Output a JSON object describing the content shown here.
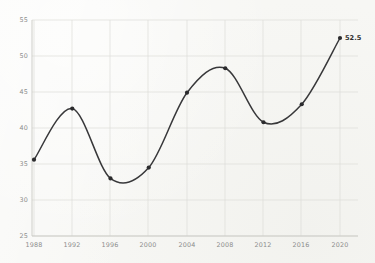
{
  "chart_data": {
    "type": "line",
    "title": "",
    "subtitle": "",
    "xlabel": "",
    "ylabel": "",
    "categories": [
      "1988",
      "1992",
      "1996",
      "2000",
      "2004",
      "2008",
      "2012",
      "2016",
      "2020"
    ],
    "x": [
      1988,
      1992,
      1996,
      2000,
      2004,
      2008,
      2012,
      2016,
      2020
    ],
    "values": [
      35.6,
      42.7,
      33.0,
      34.5,
      44.9,
      48.3,
      40.8,
      43.3,
      52.5
    ],
    "series": [
      {
        "name": "",
        "values": [
          35.6,
          42.7,
          33.0,
          34.5,
          44.9,
          48.3,
          40.8,
          43.3,
          52.5
        ]
      }
    ],
    "xlim": [
      1988,
      2020
    ],
    "ylim": [
      25,
      55
    ],
    "ytick_labels": [
      "55",
      "50",
      "45",
      "40",
      "35",
      "30",
      "25"
    ],
    "ytick_values": [
      55,
      50,
      45,
      40,
      35,
      30,
      25
    ],
    "xtick_labels": [
      "1988",
      "1992",
      "1996",
      "2000",
      "2004",
      "2008",
      "2012",
      "2016",
      "2020"
    ],
    "grid": true,
    "legend": false,
    "legend_position": "none",
    "markers": true,
    "smoothing": "spline",
    "annotations": [
      {
        "label": "52.5",
        "x": 2020,
        "y": 52.5
      }
    ],
    "colors": {
      "line": "#38383a",
      "marker": "#2b2b2d",
      "grid": "#dcdcd8",
      "axis": "#c9c9c4",
      "tick_text": "#8d8d8d",
      "label_text": "#2e2e2e",
      "background": "#f7f7f4"
    }
  }
}
